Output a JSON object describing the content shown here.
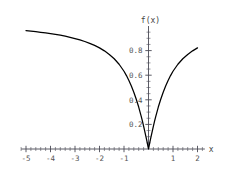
{
  "chart_data": {
    "type": "line",
    "title": "",
    "xlabel": "x",
    "ylabel": "f(x)",
    "xlim": [
      -5.2,
      2.3
    ],
    "ylim": [
      -0.06,
      1.0
    ],
    "grid": false,
    "legend": "none",
    "x_ticks": [
      {
        "value": -5,
        "label": "-5"
      },
      {
        "value": -4,
        "label": "-4"
      },
      {
        "value": -3,
        "label": "-3"
      },
      {
        "value": -2,
        "label": "-2"
      },
      {
        "value": -1,
        "label": "-1"
      },
      {
        "value": 1,
        "label": "1"
      },
      {
        "value": 2,
        "label": "2"
      }
    ],
    "y_ticks": [
      {
        "value": 0.2,
        "label": "0.2"
      },
      {
        "value": 0.4,
        "label": "0.4"
      },
      {
        "value": 0.6,
        "label": "0.6"
      },
      {
        "value": 0.8,
        "label": "0.8"
      }
    ],
    "x_minor_tick_step": 0.2,
    "y_minor_tick_step": 0.05,
    "series": [
      {
        "name": "f(x)",
        "color": "#000000",
        "x": [
          -5.0,
          -4.8,
          -4.6,
          -4.4,
          -4.2,
          -4.0,
          -3.8,
          -3.6,
          -3.4,
          -3.2,
          -3.0,
          -2.8,
          -2.6,
          -2.4,
          -2.2,
          -2.0,
          -1.8,
          -1.6,
          -1.4,
          -1.2,
          -1.0,
          -0.9,
          -0.8,
          -0.7,
          -0.6,
          -0.5,
          -0.4,
          -0.3,
          -0.25,
          -0.2,
          -0.15,
          -0.1,
          -0.05,
          -0.02,
          0.0,
          0.02,
          0.05,
          0.1,
          0.15,
          0.2,
          0.25,
          0.3,
          0.4,
          0.5,
          0.6,
          0.7,
          0.8,
          0.9,
          1.0,
          1.2,
          1.4,
          1.6,
          1.8,
          2.0
        ],
        "y": [
          0.962,
          0.958,
          0.954,
          0.949,
          0.944,
          0.938,
          0.932,
          0.925,
          0.917,
          0.908,
          0.898,
          0.887,
          0.874,
          0.859,
          0.842,
          0.822,
          0.798,
          0.769,
          0.734,
          0.689,
          0.632,
          0.597,
          0.557,
          0.512,
          0.462,
          0.405,
          0.341,
          0.268,
          0.228,
          0.186,
          0.142,
          0.097,
          0.049,
          0.02,
          0.0,
          0.02,
          0.049,
          0.097,
          0.142,
          0.186,
          0.228,
          0.268,
          0.341,
          0.405,
          0.462,
          0.512,
          0.557,
          0.597,
          0.632,
          0.689,
          0.734,
          0.769,
          0.798,
          0.822
        ]
      }
    ]
  },
  "labels": {
    "y_axis_title": "f(x)",
    "x_axis_title": "x"
  }
}
